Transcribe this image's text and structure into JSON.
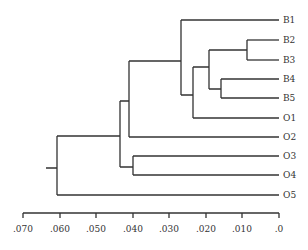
{
  "diagram": {
    "type": "dendrogram",
    "leaves": [
      "B1",
      "B2",
      "B3",
      "B4",
      "B5",
      "O1",
      "O2",
      "O3",
      "O4",
      "O5"
    ],
    "axis": {
      "ticks": [
        ".070",
        ".060",
        ".050",
        ".040",
        ".030",
        ".020",
        ".010",
        ".0"
      ],
      "range": [
        0.07,
        0.0
      ]
    },
    "merges": [
      {
        "children": [
          "B2",
          "B3"
        ],
        "height": 0.009
      },
      {
        "children": [
          "B4",
          "B5"
        ],
        "height": 0.016
      },
      {
        "children": [
          "B2-B3",
          "B4-B5"
        ],
        "height": 0.019
      },
      {
        "children": [
          "B2-B5",
          "O1"
        ],
        "height": 0.0235
      },
      {
        "children": [
          "B1",
          "B2-B5-O1"
        ],
        "height": 0.027
      },
      {
        "children": [
          "B1-O1",
          "O2"
        ],
        "height": 0.041
      },
      {
        "children": [
          "O3",
          "O4"
        ],
        "height": 0.04
      },
      {
        "children": [
          "B1-O2",
          "O3-O4"
        ],
        "height": 0.0435
      },
      {
        "children": [
          "B1-O4",
          "O5"
        ],
        "height": 0.0607
      }
    ],
    "line_color": "#333333"
  }
}
